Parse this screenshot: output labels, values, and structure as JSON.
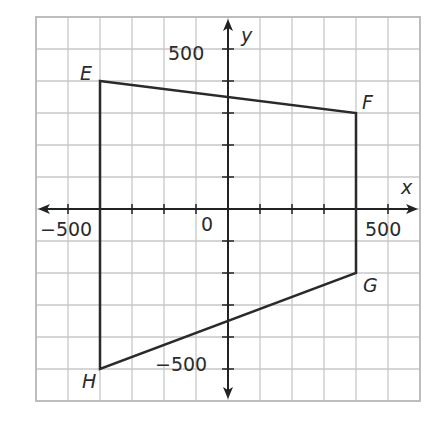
{
  "diagram": {
    "type": "coordinate-plane",
    "grid": {
      "x_min": -600,
      "x_max": 600,
      "y_min": -600,
      "y_max": 600,
      "step": 100,
      "grid_color": "#c8c8c8",
      "border_color": "#bdbdbd"
    },
    "axes": {
      "x_label": "x",
      "y_label": "y",
      "color": "#222222",
      "tick_labels": {
        "x_neg": "−500",
        "x_pos": "500",
        "y_pos": "500",
        "y_neg": "−500",
        "origin": "0"
      }
    },
    "polygon": {
      "name": "EFGH",
      "stroke": "#2a2a2a",
      "vertices": [
        {
          "label": "E",
          "x": -400,
          "y": 400
        },
        {
          "label": "F",
          "x": 400,
          "y": 300
        },
        {
          "label": "G",
          "x": 400,
          "y": -200
        },
        {
          "label": "H",
          "x": -400,
          "y": -500
        }
      ]
    }
  }
}
